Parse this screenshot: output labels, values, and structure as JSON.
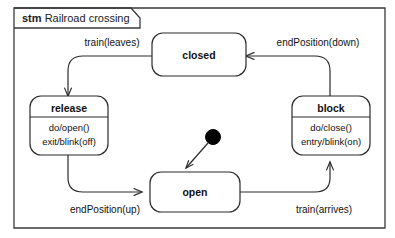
{
  "frame": {
    "keyword": "stm",
    "title": "Railroad crossing"
  },
  "states": [
    {
      "id": "closed",
      "name": "closed",
      "activities": []
    },
    {
      "id": "release",
      "name": "release",
      "activities": [
        "do/open()",
        "exit/blink(off)"
      ]
    },
    {
      "id": "block",
      "name": "block",
      "activities": [
        "do/close()",
        "entry/blink(on)"
      ]
    },
    {
      "id": "open",
      "name": "open",
      "activities": []
    }
  ],
  "transitions": [
    {
      "id": "closed-to-release",
      "label": "train(leaves)",
      "from": "closed",
      "to": "release"
    },
    {
      "id": "block-to-closed",
      "label": "endPosition(down)",
      "from": "block",
      "to": "closed"
    },
    {
      "id": "release-to-open",
      "label": "endPosition(up)",
      "from": "release",
      "to": "open"
    },
    {
      "id": "open-to-block",
      "label": "train(arrives)",
      "from": "open",
      "to": "block"
    },
    {
      "id": "initial-to-open",
      "label": "",
      "from": "initial",
      "to": "open"
    }
  ],
  "initial_node": {
    "name": "initial-pseudostate"
  },
  "colors": {
    "stroke": "#2b2b2b",
    "text": "#111111",
    "background": "#ffffff",
    "initial_fill": "#000000"
  }
}
